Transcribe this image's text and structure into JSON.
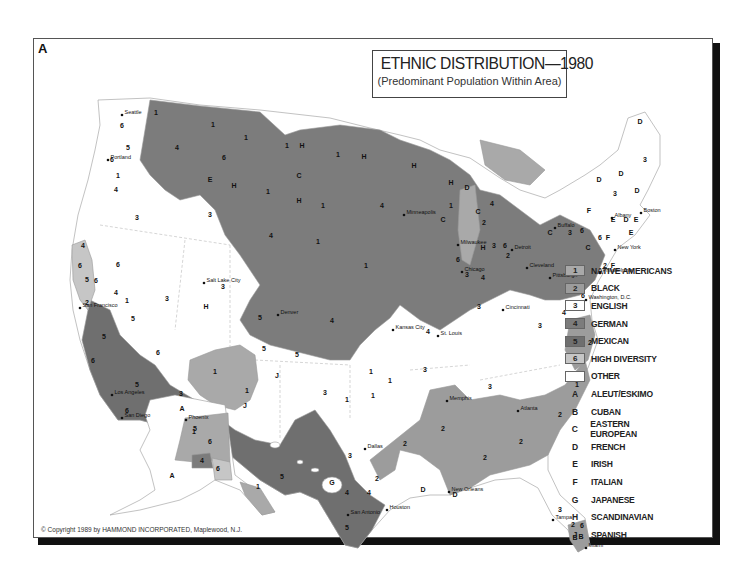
{
  "panel_letter": "A",
  "title": {
    "main": "ETHNIC DISTRIBUTION—1980",
    "subtitle": "(Predominant Population Within Area)"
  },
  "colors": {
    "native_americans": "#a9a9a9",
    "black": "#9c9c9c",
    "english": "#ffffff",
    "german": "#7c7c7c",
    "mexican": "#6f6f6f",
    "high_diversity": "#c6c6c6",
    "other": "#ffffff",
    "border": "#999999"
  },
  "legend": {
    "numbered": [
      {
        "code": "1",
        "label": "NATIVE AMERICANS",
        "color": "#a9a9a9"
      },
      {
        "code": "2",
        "label": "BLACK",
        "color": "#9c9c9c"
      },
      {
        "code": "3",
        "label": "ENGLISH",
        "color": "#ffffff"
      },
      {
        "code": "4",
        "label": "GERMAN",
        "color": "#7c7c7c"
      },
      {
        "code": "5",
        "label": "MEXICAN",
        "color": "#6f6f6f"
      },
      {
        "code": "6",
        "label": "HIGH DIVERSITY",
        "color": "#c6c6c6"
      },
      {
        "code": "",
        "label": "OTHER",
        "color": "#ffffff"
      }
    ],
    "lettered": [
      {
        "code": "A",
        "label": "ALEUT/ESKIMO"
      },
      {
        "code": "B",
        "label": "CUBAN"
      },
      {
        "code": "C",
        "label": "EASTERN EUROPEAN"
      },
      {
        "code": "D",
        "label": "FRENCH"
      },
      {
        "code": "E",
        "label": "IRISH"
      },
      {
        "code": "F",
        "label": "ITALIAN"
      },
      {
        "code": "G",
        "label": "JAPANESE"
      },
      {
        "code": "H",
        "label": "SCANDINAVIAN"
      },
      {
        "code": "J",
        "label": "SPANISH"
      }
    ]
  },
  "cities": [
    {
      "name": "Seattle",
      "x": 122,
      "y": 115
    },
    {
      "name": "Portland",
      "x": 108,
      "y": 160
    },
    {
      "name": "San Francisco",
      "x": 80,
      "y": 308
    },
    {
      "name": "Los Angeles",
      "x": 112,
      "y": 395
    },
    {
      "name": "San Diego",
      "x": 122,
      "y": 418
    },
    {
      "name": "Salt Lake City",
      "x": 204,
      "y": 283
    },
    {
      "name": "Phoenix",
      "x": 186,
      "y": 420
    },
    {
      "name": "Denver",
      "x": 278,
      "y": 315
    },
    {
      "name": "Minneapolis",
      "x": 404,
      "y": 215
    },
    {
      "name": "Milwaukee",
      "x": 458,
      "y": 245
    },
    {
      "name": "Chicago",
      "x": 462,
      "y": 272
    },
    {
      "name": "Detroit",
      "x": 512,
      "y": 250
    },
    {
      "name": "Cleveland",
      "x": 527,
      "y": 268
    },
    {
      "name": "Buffalo",
      "x": 555,
      "y": 228
    },
    {
      "name": "Pittsburgh",
      "x": 550,
      "y": 278
    },
    {
      "name": "Albany",
      "x": 612,
      "y": 218
    },
    {
      "name": "Boston",
      "x": 641,
      "y": 213
    },
    {
      "name": "New York",
      "x": 615,
      "y": 250
    },
    {
      "name": "Philadelphia",
      "x": 600,
      "y": 273
    },
    {
      "name": "Washington, D.C.",
      "x": 586,
      "y": 300
    },
    {
      "name": "Cincinnati",
      "x": 503,
      "y": 310
    },
    {
      "name": "Kansas City",
      "x": 393,
      "y": 330
    },
    {
      "name": "St. Louis",
      "x": 438,
      "y": 336
    },
    {
      "name": "Memphis",
      "x": 447,
      "y": 401
    },
    {
      "name": "Atlanta",
      "x": 518,
      "y": 411
    },
    {
      "name": "Dallas",
      "x": 365,
      "y": 449
    },
    {
      "name": "Houston",
      "x": 387,
      "y": 510
    },
    {
      "name": "San Antonio",
      "x": 348,
      "y": 515
    },
    {
      "name": "New Orleans",
      "x": 449,
      "y": 492
    },
    {
      "name": "Tampa",
      "x": 553,
      "y": 520
    },
    {
      "name": "Miami",
      "x": 586,
      "y": 548
    }
  ],
  "region_codes": [
    {
      "t": "6",
      "x": 122,
      "y": 128
    },
    {
      "t": "5",
      "x": 128,
      "y": 150
    },
    {
      "t": "1",
      "x": 156,
      "y": 115
    },
    {
      "t": "4",
      "x": 177,
      "y": 150
    },
    {
      "t": "1",
      "x": 213,
      "y": 127
    },
    {
      "t": "6",
      "x": 224,
      "y": 160
    },
    {
      "t": "1",
      "x": 246,
      "y": 140
    },
    {
      "t": "1",
      "x": 287,
      "y": 148
    },
    {
      "t": "H",
      "x": 302,
      "y": 148
    },
    {
      "t": "1",
      "x": 338,
      "y": 157
    },
    {
      "t": "H",
      "x": 364,
      "y": 159
    },
    {
      "t": "H",
      "x": 414,
      "y": 168
    },
    {
      "t": "6",
      "x": 112,
      "y": 162
    },
    {
      "t": "1",
      "x": 118,
      "y": 178
    },
    {
      "t": "4",
      "x": 116,
      "y": 192
    },
    {
      "t": "E",
      "x": 210,
      "y": 182
    },
    {
      "t": "H",
      "x": 234,
      "y": 188
    },
    {
      "t": "C",
      "x": 299,
      "y": 178
    },
    {
      "t": "1",
      "x": 268,
      "y": 194
    },
    {
      "t": "H",
      "x": 299,
      "y": 203
    },
    {
      "t": "1",
      "x": 323,
      "y": 208
    },
    {
      "t": "3",
      "x": 137,
      "y": 220
    },
    {
      "t": "3",
      "x": 210,
      "y": 217
    },
    {
      "t": "4",
      "x": 382,
      "y": 208
    },
    {
      "t": "4",
      "x": 271,
      "y": 238
    },
    {
      "t": "1",
      "x": 318,
      "y": 244
    },
    {
      "t": "1",
      "x": 366,
      "y": 268
    },
    {
      "t": "H",
      "x": 451,
      "y": 185
    },
    {
      "t": "D",
      "x": 467,
      "y": 190
    },
    {
      "t": "1",
      "x": 451,
      "y": 208
    },
    {
      "t": "C",
      "x": 443,
      "y": 222
    },
    {
      "t": "4",
      "x": 492,
      "y": 206
    },
    {
      "t": "C",
      "x": 478,
      "y": 214
    },
    {
      "t": "2",
      "x": 484,
      "y": 225
    },
    {
      "t": "H",
      "x": 483,
      "y": 250
    },
    {
      "t": "3",
      "x": 494,
      "y": 248
    },
    {
      "t": "6",
      "x": 505,
      "y": 248
    },
    {
      "t": "2",
      "x": 508,
      "y": 258
    },
    {
      "t": "6",
      "x": 458,
      "y": 262
    },
    {
      "t": "3",
      "x": 467,
      "y": 277
    },
    {
      "t": "4",
      "x": 483,
      "y": 280
    },
    {
      "t": "C",
      "x": 550,
      "y": 235
    },
    {
      "t": "3",
      "x": 570,
      "y": 235
    },
    {
      "t": "6",
      "x": 582,
      "y": 233
    },
    {
      "t": "C",
      "x": 588,
      "y": 250
    },
    {
      "t": "6",
      "x": 600,
      "y": 240
    },
    {
      "t": "F",
      "x": 608,
      "y": 240
    },
    {
      "t": "4",
      "x": 568,
      "y": 270
    },
    {
      "t": "D",
      "x": 640,
      "y": 124
    },
    {
      "t": "3",
      "x": 645,
      "y": 162
    },
    {
      "t": "D",
      "x": 621,
      "y": 176
    },
    {
      "t": "D",
      "x": 599,
      "y": 182
    },
    {
      "t": "3",
      "x": 615,
      "y": 196
    },
    {
      "t": "D",
      "x": 637,
      "y": 193
    },
    {
      "t": "F",
      "x": 589,
      "y": 213
    },
    {
      "t": "E",
      "x": 613,
      "y": 222
    },
    {
      "t": "D",
      "x": 626,
      "y": 222
    },
    {
      "t": "E",
      "x": 636,
      "y": 222
    },
    {
      "t": "E",
      "x": 631,
      "y": 235
    },
    {
      "t": "2",
      "x": 605,
      "y": 268
    },
    {
      "t": "F",
      "x": 613,
      "y": 268
    },
    {
      "t": "6",
      "x": 583,
      "y": 298
    },
    {
      "t": "4",
      "x": 564,
      "y": 315
    },
    {
      "t": "2",
      "x": 590,
      "y": 345
    },
    {
      "t": "1",
      "x": 577,
      "y": 387
    },
    {
      "t": "3",
      "x": 540,
      "y": 328
    },
    {
      "t": "3",
      "x": 479,
      "y": 309
    },
    {
      "t": "3",
      "x": 167,
      "y": 301
    },
    {
      "t": "H",
      "x": 206,
      "y": 309
    },
    {
      "t": "3",
      "x": 223,
      "y": 289
    },
    {
      "t": "6",
      "x": 80,
      "y": 268
    },
    {
      "t": "4",
      "x": 83,
      "y": 248
    },
    {
      "t": "6",
      "x": 118,
      "y": 267
    },
    {
      "t": "5",
      "x": 87,
      "y": 282
    },
    {
      "t": "6",
      "x": 96,
      "y": 283
    },
    {
      "t": "4",
      "x": 116,
      "y": 295
    },
    {
      "t": "1",
      "x": 127,
      "y": 303
    },
    {
      "t": "2",
      "x": 87,
      "y": 305
    },
    {
      "t": "5",
      "x": 133,
      "y": 321
    },
    {
      "t": "5",
      "x": 104,
      "y": 339
    },
    {
      "t": "6",
      "x": 93,
      "y": 363
    },
    {
      "t": "5",
      "x": 137,
      "y": 387
    },
    {
      "t": "6",
      "x": 127,
      "y": 413
    },
    {
      "t": "6",
      "x": 158,
      "y": 355
    },
    {
      "t": "3",
      "x": 181,
      "y": 396
    },
    {
      "t": "5",
      "x": 195,
      "y": 431
    },
    {
      "t": "1",
      "x": 215,
      "y": 374
    },
    {
      "t": "1",
      "x": 247,
      "y": 393
    },
    {
      "t": "J",
      "x": 277,
      "y": 378
    },
    {
      "t": "J",
      "x": 245,
      "y": 408
    },
    {
      "t": "5",
      "x": 260,
      "y": 320
    },
    {
      "t": "5",
      "x": 264,
      "y": 351
    },
    {
      "t": "5",
      "x": 297,
      "y": 357
    },
    {
      "t": "4",
      "x": 332,
      "y": 323
    },
    {
      "t": "3",
      "x": 325,
      "y": 395
    },
    {
      "t": "1",
      "x": 347,
      "y": 402
    },
    {
      "t": "1",
      "x": 371,
      "y": 374
    },
    {
      "t": "1",
      "x": 390,
      "y": 383
    },
    {
      "t": "1",
      "x": 373,
      "y": 398
    },
    {
      "t": "3",
      "x": 425,
      "y": 372
    },
    {
      "t": "4",
      "x": 428,
      "y": 334
    },
    {
      "t": "3",
      "x": 490,
      "y": 389
    },
    {
      "t": "2",
      "x": 443,
      "y": 431
    },
    {
      "t": "2",
      "x": 405,
      "y": 446
    },
    {
      "t": "2",
      "x": 485,
      "y": 460
    },
    {
      "t": "2",
      "x": 521,
      "y": 444
    },
    {
      "t": "2",
      "x": 560,
      "y": 417
    },
    {
      "t": "3",
      "x": 350,
      "y": 458
    },
    {
      "t": "2",
      "x": 377,
      "y": 481
    },
    {
      "t": "4",
      "x": 347,
      "y": 495
    },
    {
      "t": "4",
      "x": 369,
      "y": 495
    },
    {
      "t": "5",
      "x": 282,
      "y": 479
    },
    {
      "t": "5",
      "x": 347,
      "y": 530
    },
    {
      "t": "D",
      "x": 423,
      "y": 492
    },
    {
      "t": "D",
      "x": 455,
      "y": 497
    },
    {
      "t": "3",
      "x": 560,
      "y": 512
    },
    {
      "t": "2",
      "x": 573,
      "y": 527
    },
    {
      "t": "6",
      "x": 582,
      "y": 528
    },
    {
      "t": "B",
      "x": 575,
      "y": 540
    },
    {
      "t": "B",
      "x": 581,
      "y": 539
    },
    {
      "t": "A",
      "x": 182,
      "y": 411
    },
    {
      "t": "A",
      "x": 172,
      "y": 478
    },
    {
      "t": "1",
      "x": 194,
      "y": 434
    },
    {
      "t": "6",
      "x": 210,
      "y": 444
    },
    {
      "t": "4",
      "x": 202,
      "y": 463
    },
    {
      "t": "6",
      "x": 218,
      "y": 471
    },
    {
      "t": "1",
      "x": 258,
      "y": 489
    },
    {
      "t": "G",
      "x": 332,
      "y": 485
    }
  ],
  "copyright": "© Copyright 1989 by HAMMOND INCORPORATED, Maplewood, N.J."
}
